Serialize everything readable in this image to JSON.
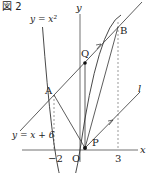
{
  "figure": {
    "title": "図 2",
    "labels": {
      "parabola": "y = x²",
      "line": "y = x + 6",
      "y_axis": "y",
      "x_axis": "x",
      "origin": "O",
      "point_A": "A",
      "point_B": "B",
      "point_Q": "Q",
      "point_P": "P",
      "line_l": "l",
      "tick_neg2": "−2",
      "tick_3": "3"
    },
    "colors": {
      "stroke": "#333333",
      "dashed": "#555555",
      "point": "#111111"
    }
  },
  "diagram_data": {
    "curves": [
      {
        "name": "parabola",
        "equation": "y = x^2"
      },
      {
        "name": "line",
        "equation": "y = x + 6"
      },
      {
        "name": "l",
        "description": "line through P parallel to y = x + 6"
      }
    ],
    "points": {
      "A": [
        -2,
        4
      ],
      "B": [
        3,
        9
      ],
      "O": [
        0,
        0
      ],
      "P": "on parabola between O and B, near origin",
      "Q": "on y = x + 6, directly above P"
    },
    "segments": [
      "A-P",
      "P-B",
      "Q-P"
    ],
    "dashed_guides": [
      "x = -2",
      "x = 3"
    ]
  }
}
